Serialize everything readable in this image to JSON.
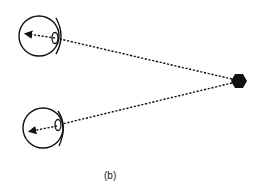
{
  "figure": {
    "caption": "(b)",
    "colors": {
      "stroke": "#111111",
      "background": "#ffffff"
    },
    "object": {
      "shape": "hexagon",
      "cx": 239,
      "cy": 81,
      "r": 8
    },
    "eyes": [
      {
        "name": "top-eye",
        "cx": 39,
        "cy": 36,
        "r": 20,
        "lens_cx": 55,
        "lens_cy": 38,
        "arrow_tip_x": 25,
        "arrow_tip_y": 34
      },
      {
        "name": "bottom-eye",
        "cx": 43,
        "cy": 128,
        "r": 20,
        "lens_cx": 58,
        "lens_cy": 124,
        "arrow_tip_x": 29,
        "arrow_tip_y": 132
      }
    ]
  }
}
